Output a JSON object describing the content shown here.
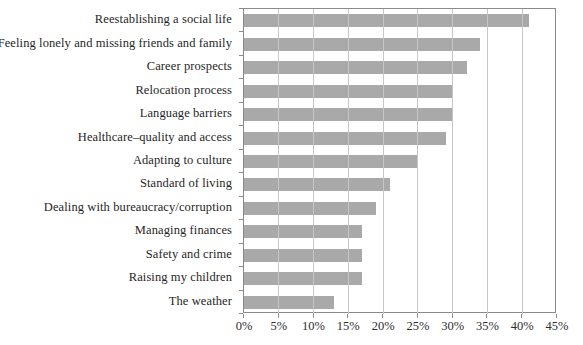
{
  "chart_data": {
    "type": "bar",
    "orientation": "horizontal",
    "title": "",
    "xlabel": "",
    "ylabel": "",
    "categories": [
      "Reestablishing a social life",
      "Feeling lonely and missing friends and family",
      "Career prospects",
      "Relocation process",
      "Language barriers",
      "Healthcare–quality and access",
      "Adapting to culture",
      "Standard of living",
      "Dealing with bureaucracy/corruption",
      "Managing finances",
      "Safety and crime",
      "Raising my children",
      "The weather"
    ],
    "values": [
      41,
      34,
      32,
      30,
      30,
      29,
      25,
      21,
      19,
      17,
      17,
      17,
      13
    ],
    "value_unit": "%",
    "xlim": [
      0,
      45
    ],
    "x_ticks": [
      0,
      5,
      10,
      15,
      20,
      25,
      30,
      35,
      40,
      45
    ],
    "x_tick_labels": [
      "0%",
      "5%",
      "10%",
      "15%",
      "20%",
      "25%",
      "30%",
      "35%",
      "40%",
      "45%"
    ],
    "grid": true,
    "legend": false,
    "colors": {
      "bar": "#a9a9a9",
      "gridline": "#c6c6c6",
      "axis": "#8a8a8a",
      "text": "#262626"
    }
  }
}
